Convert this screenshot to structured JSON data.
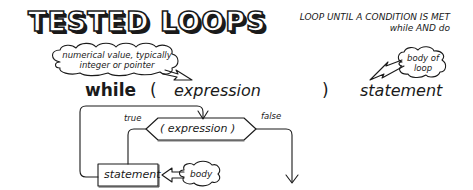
{
  "title": "TESTED LOOPS",
  "header": {
    "line1": "LOOP UNTIL A CONDITION IS MET",
    "line2": "while AND do"
  },
  "syntax": {
    "keyword": "while",
    "open_paren": "(",
    "expression": "expression",
    "close_paren": ")",
    "statement": "statement"
  },
  "callouts": {
    "expression_note_line1": "numerical value, typically",
    "expression_note_line2": "integer or pointer",
    "body_note_line1": "body of",
    "body_note_line2": "loop"
  },
  "flowchart": {
    "condition": "( expression )",
    "true_label": "true",
    "false_label": "false",
    "statement_box": "statement",
    "body_label": "body"
  },
  "colors": {
    "ink": "#1a1a1a",
    "background": "#ffffff"
  }
}
